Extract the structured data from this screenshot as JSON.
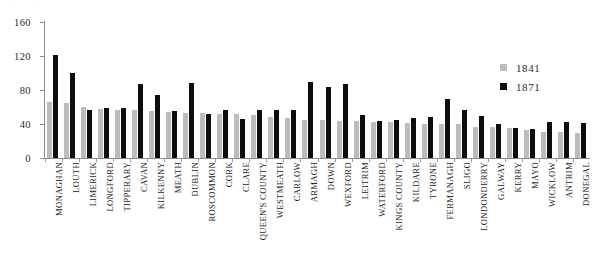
{
  "figure": {
    "top_strip_text": "· · ·",
    "background": "#ffffff"
  },
  "legend": {
    "position": "top-right",
    "entries": [
      {
        "label": "1841",
        "color": "#bcbcbc",
        "swatch": "square-swatch"
      },
      {
        "label": "1871",
        "color": "#0d0d0d",
        "swatch": "square-swatch"
      }
    ]
  },
  "axis": {
    "y_ticks": [
      "160",
      "120",
      "80",
      "40",
      "0"
    ],
    "y_values": [
      160,
      120,
      80,
      40,
      0
    ],
    "y_min": 0,
    "y_max": 160
  },
  "chart_data": {
    "type": "bar",
    "title": "",
    "subtitle": "",
    "xlabel": "",
    "ylabel": "",
    "ylim": [
      0,
      160
    ],
    "grid": false,
    "legend_position": "top-right",
    "categories": [
      "MONAGHAN",
      "LOUTH",
      "LIMERICK",
      "LONGFORD",
      "TIPPERARY",
      "CAVAN",
      "KILKENNY",
      "MEATH",
      "DUBLIN",
      "ROSCOMMON",
      "CORK",
      "CLARE",
      "QUEEN'S COUNTY",
      "WESTMEATH",
      "CARLOW",
      "ARMAGH",
      "DOWN",
      "WEXFORD",
      "LEITRIM",
      "WATERFORD",
      "KINGS COUNTY",
      "KILDARE",
      "TYRONE",
      "FERMANAGH",
      "SLIGO",
      "LONDONDERRY",
      "GALWAY",
      "KERRY",
      "MAYO",
      "WICKLOW",
      "ANTRIM",
      "DONEGAL"
    ],
    "series": [
      {
        "name": "1841",
        "color": "#bcbcbc",
        "values": [
          66,
          65,
          60,
          58,
          57,
          56,
          55,
          54,
          53,
          53,
          52,
          52,
          51,
          48,
          47,
          45,
          45,
          44,
          43,
          42,
          42,
          41,
          40,
          40,
          40,
          36,
          36,
          35,
          33,
          31,
          31,
          29
        ]
      },
      {
        "name": "1871",
        "color": "#0d0d0d",
        "values": [
          121,
          100,
          56,
          59,
          59,
          87,
          74,
          55,
          88,
          52,
          57,
          46,
          56,
          57,
          57,
          90,
          84,
          87,
          51,
          43,
          45,
          47,
          48,
          70,
          57,
          49,
          40,
          35,
          34,
          42,
          42,
          41
        ]
      }
    ]
  }
}
